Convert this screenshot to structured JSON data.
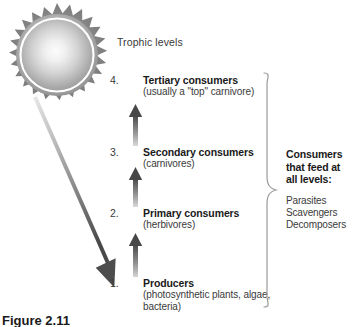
{
  "figure": {
    "caption": "Figure 2.11",
    "trophic_header": "Trophic levels"
  },
  "levels": [
    {
      "number": "4.",
      "title": "Tertiary consumers",
      "subtitle": "(usually a \"top\" carnivore)"
    },
    {
      "number": "3.",
      "title": "Secondary consumers",
      "subtitle": "(carnivores)"
    },
    {
      "number": "2.",
      "title": "Primary consumers",
      "subtitle": "(herbivores)"
    },
    {
      "number": "1.",
      "title": "Producers",
      "subtitle": "(photosynthetic plants, algae, bacteria)"
    }
  ],
  "side_note": {
    "title": "Consumers that feed at all levels:",
    "items": [
      "Parasites",
      "Scavengers",
      "Decomposers"
    ]
  },
  "colors": {
    "text_dark": "#1a1a1a",
    "text_body": "#3a3a3a",
    "arrow_dark": "#4f4f4f",
    "arrow_light": "#d8d8d8",
    "sun_gray": "#8a8a8a",
    "brace_line": "#9a9a9a",
    "background": "#ffffff"
  }
}
